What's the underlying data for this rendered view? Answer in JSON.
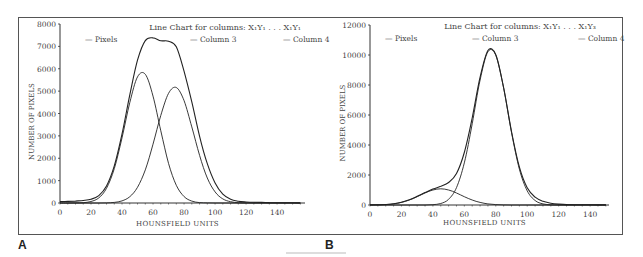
{
  "figure": {
    "panel_labels": [
      "A",
      "B"
    ]
  },
  "chart_data": [
    {
      "type": "line",
      "panel": "A",
      "title": "Line Chart for columns: X₁Y₁ . . . X₁Y₁",
      "xlabel": "HOUNSFIELD UNITS",
      "ylabel": "NUMBER OF PIXELS",
      "xlim": [
        0,
        158
      ],
      "ylim": [
        0,
        8000
      ],
      "xticks": [
        0,
        20,
        40,
        60,
        80,
        100,
        120,
        140
      ],
      "yticks": [
        0,
        1000,
        2000,
        3000,
        4000,
        5000,
        6000,
        7000,
        8000
      ],
      "grid": false,
      "legend": [
        "Pixels",
        "Column 3",
        "Column 4"
      ],
      "legend_position": "top",
      "x": [
        0,
        5,
        10,
        15,
        20,
        25,
        30,
        35,
        40,
        45,
        50,
        55,
        60,
        65,
        70,
        75,
        80,
        85,
        90,
        95,
        100,
        105,
        110,
        115,
        120,
        125,
        130,
        135,
        140,
        145,
        150,
        155
      ],
      "series": [
        {
          "name": "Pixels",
          "values": [
            60,
            70,
            85,
            110,
            165,
            330,
            760,
            1660,
            3080,
            4830,
            6380,
            7260,
            7380,
            7250,
            7230,
            6980,
            5880,
            4520,
            2980,
            1760,
            900,
            400,
            170,
            80,
            45,
            30,
            25,
            20,
            15,
            10,
            8,
            5
          ]
        },
        {
          "name": "Column 3",
          "values": [
            0,
            0,
            3,
            15,
            65,
            229,
            658,
            1537,
            2910,
            4490,
            5637,
            5754,
            4778,
            3227,
            1773,
            792,
            288,
            85,
            20,
            4,
            0,
            0,
            0,
            0,
            0,
            0,
            0,
            0,
            0,
            0,
            0,
            0
          ]
        },
        {
          "name": "Column 4",
          "values": [
            0,
            0,
            0,
            0,
            0,
            1,
            6,
            26,
            94,
            280,
            701,
            1481,
            2627,
            3914,
            4900,
            5162,
            4571,
            3403,
            2129,
            1118,
            494,
            183,
            57,
            15,
            3,
            0,
            0,
            0,
            0,
            0,
            0,
            0
          ]
        }
      ]
    },
    {
      "type": "line",
      "panel": "B",
      "title": "Line Chart for columns: X₁Y₁ . . . X₁Y₃",
      "xlabel": "HOUNSFIELD UNITS",
      "ylabel": "NUMBER OF PIXELS",
      "xlim": [
        0,
        152
      ],
      "ylim": [
        0,
        12000
      ],
      "xticks": [
        0,
        20,
        40,
        60,
        80,
        100,
        120,
        140
      ],
      "yticks": [
        0,
        2000,
        4000,
        6000,
        8000,
        10000,
        12000
      ],
      "grid": false,
      "legend": [
        "Pixels",
        "Column 3",
        "Column 4"
      ],
      "legend_position": "top",
      "x": [
        0,
        5,
        10,
        15,
        20,
        25,
        30,
        35,
        40,
        45,
        50,
        55,
        60,
        65,
        70,
        75,
        80,
        85,
        90,
        95,
        100,
        105,
        110,
        115,
        120,
        125,
        130,
        135,
        140,
        145,
        150
      ],
      "series": [
        {
          "name": "Pixels",
          "values": [
            10,
            15,
            35,
            85,
            185,
            350,
            580,
            830,
            1060,
            1250,
            1500,
            2100,
            3500,
            5800,
            8520,
            10300,
            10020,
            7800,
            4900,
            2520,
            1150,
            520,
            250,
            120,
            60,
            30,
            20,
            15,
            10,
            8,
            5
          ]
        },
        {
          "name": "Column 3",
          "values": [
            3,
            9,
            29,
            75,
            170,
            331,
            554,
            803,
            1003,
            1080,
            1003,
            803,
            554,
            331,
            170,
            75,
            29,
            9,
            3,
            0,
            0,
            0,
            0,
            0,
            0,
            0,
            0,
            0,
            0,
            0,
            0
          ]
        },
        {
          "name": "Column 4",
          "values": [
            0,
            0,
            0,
            0,
            0,
            0,
            0,
            3,
            21,
            100,
            380,
            1160,
            2806,
            5416,
            8330,
            10213,
            9985,
            7780,
            4840,
            2390,
            945,
            297,
            74,
            15,
            3,
            0,
            0,
            0,
            0,
            0,
            0
          ]
        }
      ]
    }
  ]
}
